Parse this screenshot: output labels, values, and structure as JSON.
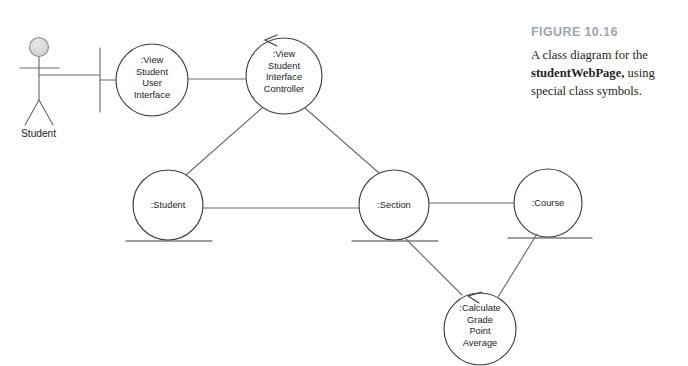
{
  "figure": {
    "number_label": "FIGURE 10.16",
    "caption_lead": "A class diagram for the ",
    "caption_bold": "studentWebPage,",
    "caption_tail": " using special class symbols."
  },
  "actor": {
    "name": "Student",
    "label": "Student"
  },
  "colors": {
    "stroke": "#58595b",
    "node_stroke": "#3f3f41",
    "text": "#1c1c1c",
    "caption_title": "#9aa6b2",
    "caption_text": "#231f20",
    "actor_head_fill": "#d8d8d8",
    "page_background": "#ffffff",
    "node_fill": "#ffffff"
  },
  "nodes": [
    {
      "id": "view-student-user-interface",
      "stereotype": "boundary",
      "label": ":View\nStudent\nUser\nInterface",
      "cx": 152,
      "cy": 80,
      "r": 36
    },
    {
      "id": "view-student-interface-controller",
      "stereotype": "control",
      "label": ":View\nStudent\nInterface\nController",
      "cx": 284,
      "cy": 76,
      "r": 38
    },
    {
      "id": "student",
      "stereotype": "entity",
      "label": ":Student",
      "cx": 168,
      "cy": 205,
      "r": 35
    },
    {
      "id": "section",
      "stereotype": "entity",
      "label": ":Section",
      "cx": 394,
      "cy": 205,
      "r": 35
    },
    {
      "id": "course",
      "stereotype": "entity",
      "label": ":Course",
      "cx": 548,
      "cy": 203,
      "r": 34
    },
    {
      "id": "calculate-grade-point-average",
      "stereotype": "control",
      "label": ":Calculate\nGrade\nPoint\nAverage",
      "cx": 480,
      "cy": 329,
      "r": 36
    }
  ],
  "associations": [
    {
      "id": "actor-to-boundary",
      "from": "Student actor",
      "to": "boundary symbol"
    },
    {
      "id": "boundary-to-view-student-user-interface",
      "from": "boundary symbol",
      "to": ":View Student User Interface"
    },
    {
      "id": "interface-to-controller",
      "from": ":View Student User Interface",
      "to": ":View Student Interface Controller"
    },
    {
      "id": "controller-to-student",
      "from": ":View Student Interface Controller",
      "to": ":Student"
    },
    {
      "id": "controller-to-section",
      "from": ":View Student Interface Controller",
      "to": ":Section"
    },
    {
      "id": "student-to-section",
      "from": ":Student",
      "to": ":Section"
    },
    {
      "id": "section-to-course",
      "from": ":Section",
      "to": ":Course"
    },
    {
      "id": "section-to-calculate-gpa",
      "from": ":Section",
      "to": ":Calculate Grade Point Average"
    },
    {
      "id": "course-to-calculate-gpa",
      "from": ":Course",
      "to": ":Calculate Grade Point Average"
    }
  ]
}
